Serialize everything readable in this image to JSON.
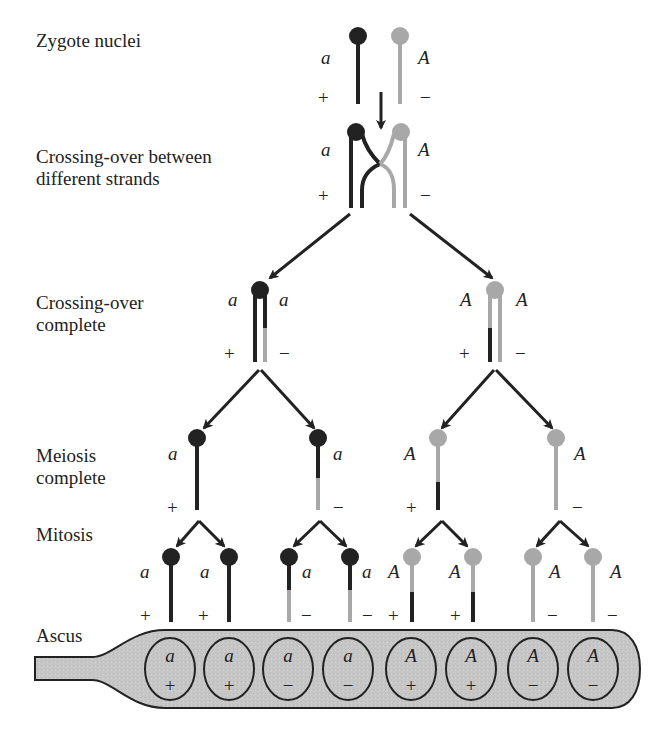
{
  "colors": {
    "dark_strand": "#222222",
    "light_strand": "#a8a8a8",
    "ascus_fill": "#c9c9c9",
    "outline": "#222222"
  },
  "stages": [
    {
      "id": "zygote",
      "label": "Zygote nuclei"
    },
    {
      "id": "crossing",
      "label": "Crossing-over between\ndifferent strands"
    },
    {
      "id": "crossing_complete",
      "label": "Crossing-over\ncomplete"
    },
    {
      "id": "meiosis",
      "label": "Meiosis\ncomplete"
    },
    {
      "id": "mitosis",
      "label": "Mitosis"
    },
    {
      "id": "ascus",
      "label": "Ascus"
    }
  ],
  "zygote": {
    "left": {
      "allele": "a",
      "mating": "+"
    },
    "right": {
      "allele": "A",
      "mating": "−"
    }
  },
  "crossing": {
    "left": {
      "allele": "a",
      "mating": "+"
    },
    "right": {
      "allele": "A",
      "mating": "−"
    }
  },
  "crossing_complete": [
    {
      "allele_left": "a",
      "allele_right": "a",
      "mating_left": "+",
      "mating_right": "−"
    },
    {
      "allele_left": "A",
      "allele_right": "A",
      "mating_left": "+",
      "mating_right": "−"
    }
  ],
  "meiosis": [
    {
      "allele": "a",
      "mating": "+"
    },
    {
      "allele": "a",
      "mating": "−"
    },
    {
      "allele": "A",
      "mating": "+"
    },
    {
      "allele": "A",
      "mating": "−"
    }
  ],
  "mitosis": [
    {
      "allele": "a",
      "mating": "+"
    },
    {
      "allele": "a",
      "mating": "+"
    },
    {
      "allele": "a",
      "mating": "−"
    },
    {
      "allele": "a",
      "mating": "−"
    },
    {
      "allele": "A",
      "mating": "+"
    },
    {
      "allele": "A",
      "mating": "+"
    },
    {
      "allele": "A",
      "mating": "−"
    },
    {
      "allele": "A",
      "mating": "−"
    }
  ],
  "ascospores": [
    {
      "allele": "a",
      "mating": "+"
    },
    {
      "allele": "a",
      "mating": "+"
    },
    {
      "allele": "a",
      "mating": "−"
    },
    {
      "allele": "a",
      "mating": "−"
    },
    {
      "allele": "A",
      "mating": "+"
    },
    {
      "allele": "A",
      "mating": "+"
    },
    {
      "allele": "A",
      "mating": "−"
    },
    {
      "allele": "A",
      "mating": "−"
    }
  ]
}
